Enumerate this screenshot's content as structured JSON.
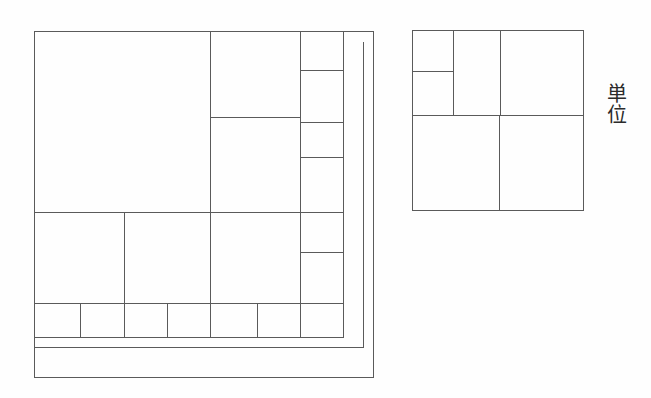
{
  "figure": {
    "background_color": "#fefefe",
    "line_color": "#5a5a5a",
    "line_width": 1,
    "canvas": {
      "width": 651,
      "height": 398
    }
  },
  "annotations": {
    "unit_label": {
      "text": "単位",
      "meaning": "unit",
      "orientation": "vertical",
      "x": 597,
      "y": 83,
      "font_size": 20,
      "color": "#2b2b2b"
    }
  },
  "chart_data": {
    "type": "diagram",
    "xlabel": "",
    "ylabel": "",
    "panels": [
      {
        "name": "main-dissection",
        "label": "large dissected square",
        "outer_frame": {
          "x": 34,
          "y": 31,
          "width": 339,
          "height": 346
        },
        "inner_square": {
          "x": 34,
          "y": 31,
          "width": 309,
          "height": 306
        },
        "rects": [
          {
            "id": "A",
            "x": 34,
            "y": 31,
            "w": 176,
            "h": 181
          },
          {
            "id": "B",
            "x": 210,
            "y": 31,
            "w": 90,
            "h": 86
          },
          {
            "id": "C",
            "x": 300,
            "y": 31,
            "w": 43,
            "h": 39
          },
          {
            "id": "D",
            "x": 300,
            "y": 70,
            "w": 43,
            "h": 52
          },
          {
            "id": "E",
            "x": 210,
            "y": 117,
            "w": 90,
            "h": 95
          },
          {
            "id": "F",
            "x": 300,
            "y": 122,
            "w": 43,
            "h": 35
          },
          {
            "id": "G",
            "x": 300,
            "y": 157,
            "w": 43,
            "h": 55
          },
          {
            "id": "H",
            "x": 34,
            "y": 212,
            "w": 90,
            "h": 91
          },
          {
            "id": "I",
            "x": 124,
            "y": 212,
            "w": 86,
            "h": 91
          },
          {
            "id": "J",
            "x": 210,
            "y": 212,
            "w": 90,
            "h": 91
          },
          {
            "id": "K",
            "x": 300,
            "y": 212,
            "w": 43,
            "h": 40
          },
          {
            "id": "L",
            "x": 300,
            "y": 252,
            "w": 43,
            "h": 51
          },
          {
            "id": "M1",
            "x": 34,
            "y": 303,
            "w": 46,
            "h": 34
          },
          {
            "id": "M2",
            "x": 80,
            "y": 303,
            "w": 44,
            "h": 34
          },
          {
            "id": "M3",
            "x": 124,
            "y": 303,
            "w": 43,
            "h": 34
          },
          {
            "id": "M4",
            "x": 167,
            "y": 303,
            "w": 43,
            "h": 34
          },
          {
            "id": "M5",
            "x": 210,
            "y": 303,
            "w": 47,
            "h": 34
          },
          {
            "id": "M6",
            "x": 257,
            "y": 303,
            "w": 43,
            "h": 34
          },
          {
            "id": "M7",
            "x": 300,
            "y": 303,
            "w": 43,
            "h": 34
          }
        ],
        "frame_lines": [
          {
            "id": "frame-right",
            "x1": 373,
            "y1": 31,
            "x2": 373,
            "y2": 377
          },
          {
            "id": "frame-top",
            "x1": 343,
            "y1": 31,
            "x2": 373,
            "y2": 31
          },
          {
            "id": "frame-bottom",
            "x1": 34,
            "y1": 377,
            "x2": 373,
            "y2": 377
          },
          {
            "id": "frame-left",
            "x1": 34,
            "y1": 337,
            "x2": 34,
            "y2": 377
          },
          {
            "id": "frame-inner-bottom",
            "x1": 34,
            "y1": 347,
            "x2": 363,
            "y2": 347
          },
          {
            "id": "frame-inner-right",
            "x1": 363,
            "y1": 41,
            "x2": 363,
            "y2": 347
          }
        ]
      },
      {
        "name": "unit-reference",
        "label": "unit reference square",
        "outer_frame": {
          "x": 412,
          "y": 30,
          "width": 171,
          "height": 180
        },
        "rects": [
          {
            "id": "U1",
            "x": 412,
            "y": 30,
            "w": 41,
            "h": 41
          },
          {
            "id": "U2",
            "x": 453,
            "y": 30,
            "w": 47,
            "h": 85
          },
          {
            "id": "U3",
            "x": 500,
            "y": 30,
            "w": 83,
            "h": 85
          },
          {
            "id": "U4",
            "x": 412,
            "y": 71,
            "w": 41,
            "h": 44
          },
          {
            "id": "U5",
            "x": 412,
            "y": 115,
            "w": 87,
            "h": 95
          },
          {
            "id": "U6",
            "x": 499,
            "y": 115,
            "w": 84,
            "h": 95
          }
        ]
      }
    ]
  }
}
